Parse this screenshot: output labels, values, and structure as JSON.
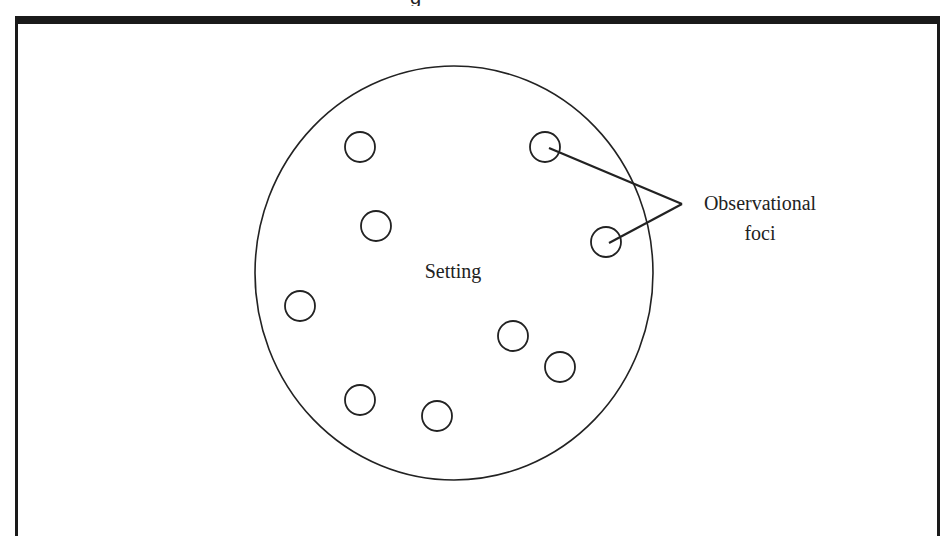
{
  "diagram": {
    "caption_fragment": "g",
    "setting": {
      "label": "Setting",
      "ellipse": {
        "cx": 454,
        "cy": 273,
        "rx": 199,
        "ry": 207
      }
    },
    "observational_foci": {
      "label_line1": "Observational",
      "label_line2": "foci",
      "circles": [
        {
          "cx": 360,
          "cy": 147,
          "r": 15
        },
        {
          "cx": 545,
          "cy": 147,
          "r": 15
        },
        {
          "cx": 376,
          "cy": 226,
          "r": 15
        },
        {
          "cx": 606,
          "cy": 242,
          "r": 15
        },
        {
          "cx": 300,
          "cy": 306,
          "r": 15
        },
        {
          "cx": 513,
          "cy": 336,
          "r": 15
        },
        {
          "cx": 560,
          "cy": 367,
          "r": 15
        },
        {
          "cx": 360,
          "cy": 400,
          "r": 15
        },
        {
          "cx": 437,
          "cy": 416,
          "r": 15
        }
      ],
      "pointer_apex": {
        "x": 682,
        "y": 204
      },
      "pointer_targets": [
        {
          "x": 549,
          "y": 148
        },
        {
          "x": 609,
          "y": 243
        }
      ]
    },
    "colors": {
      "stroke": "#222222",
      "frame": "#1a1a1a",
      "background": "#ffffff"
    }
  }
}
